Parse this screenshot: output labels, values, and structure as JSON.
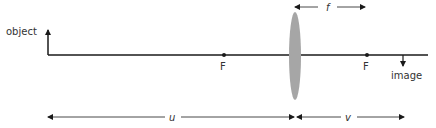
{
  "labels": {
    "object": "object",
    "image": "image",
    "focal_left": "F",
    "focal_right": "F",
    "f": "f",
    "u": "u",
    "v": "v"
  },
  "colors": {
    "line": "#1a1a1a",
    "lens": "#a6a6a6",
    "text": "#333333"
  }
}
